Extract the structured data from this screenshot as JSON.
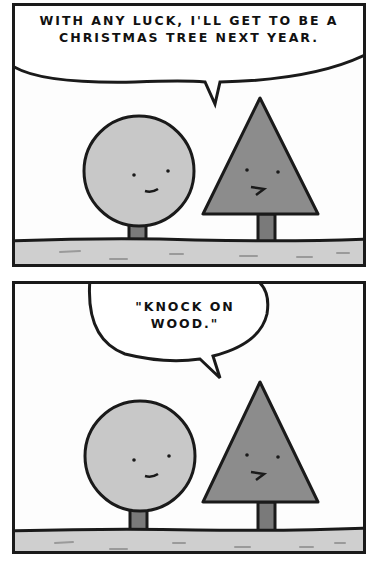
{
  "comic": {
    "panels": [
      {
        "speech": "WITH ANY LUCK, I'LL GET TO BE A CHRISTMAS TREE NEXT YEAR.",
        "speaker": "triangle-tree"
      },
      {
        "speech": "\"KNOCK ON WOOD.\"",
        "speaker": "triangle-tree"
      }
    ],
    "colors": {
      "ink": "#1a1a1a",
      "round_tree": "#c8c8c8",
      "triangle_tree": "#8c8c8c",
      "trunk": "#7a7a7a",
      "ground": "#cfcfcf",
      "background": "#fdfdfd"
    }
  }
}
